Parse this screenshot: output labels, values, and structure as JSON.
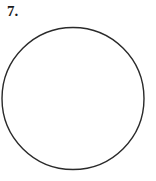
{
  "problem": {
    "number_label": "7."
  },
  "figure": {
    "shape": "circle",
    "center": [
      73,
      98.5
    ],
    "radius": 71,
    "stroke_color": "#2a2a2a",
    "stroke_width": 1.4,
    "fill": "none"
  }
}
